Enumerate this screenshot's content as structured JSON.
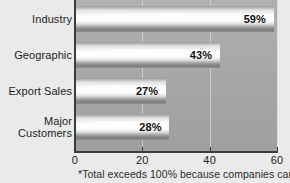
{
  "chart_data": {
    "type": "bar",
    "orientation": "horizontal",
    "title": "",
    "xlabel": "",
    "ylabel": "",
    "categories": [
      "Industry",
      "Geographic",
      "Export Sales",
      "Major\nCustomers"
    ],
    "values": [
      59,
      43,
      27,
      28
    ],
    "value_labels": [
      "59%",
      "43%",
      "27%",
      "28%"
    ],
    "xlim": [
      0,
      60
    ],
    "xticks": [
      0,
      20,
      40,
      60
    ],
    "xtick_labels": [
      "0",
      "20",
      "40",
      "60"
    ],
    "grid": true,
    "gridlines_at": [
      20,
      40,
      60
    ],
    "legend": null,
    "annotations": [
      "*Total exceeds 100% because companies can"
    ],
    "colors": {
      "plot_background": "#a9a9a9",
      "page_background": "#ebeaea",
      "bar_highlight": "#ffffff",
      "bar_shadow": "#7e7e7e",
      "axis": "#3c3c3c",
      "gridline": "#d8d8d8",
      "text": "#1c1c1c"
    }
  },
  "footnote": "*Total exceeds 100% because companies can"
}
